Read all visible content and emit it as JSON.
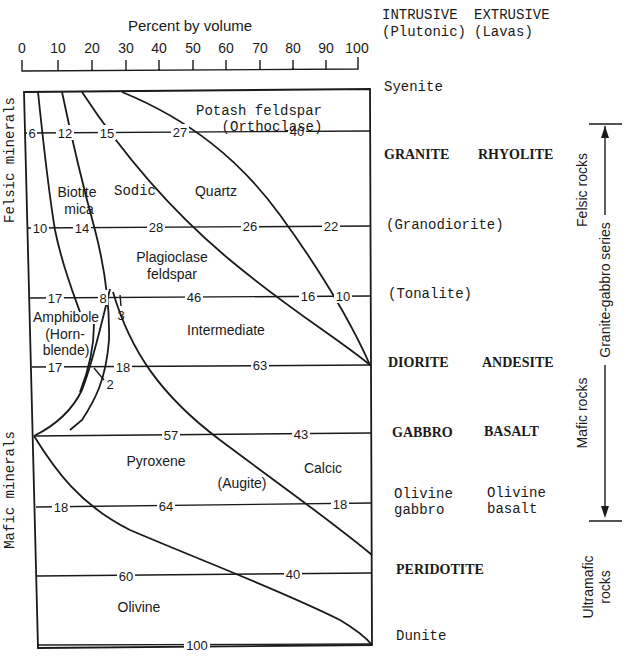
{
  "scale": {
    "title": "Percent by volume",
    "ticks": [
      "0",
      "10",
      "20",
      "30",
      "40",
      "50",
      "60",
      "70",
      "80",
      "90",
      "100"
    ]
  },
  "axis_labels": {
    "felsic_minerals": "Felsic minerals",
    "mafic_minerals": "Mafic minerals"
  },
  "column_headers": {
    "intrusive": "INTRUSIVE",
    "intrusive_sub": "(Plutonic)",
    "extrusive": "EXTRUSIVE",
    "extrusive_sub": "(Lavas)"
  },
  "mineral_labels": {
    "potash_feldspar": "Potash feldspar",
    "orthoclase": "(Orthoclase)",
    "biotite": "Biotite",
    "mica": "mica",
    "sodic": "Sodic",
    "quartz": "Quartz",
    "plagioclase": "Plagioclase",
    "feldspar": "feldspar",
    "amphibole": "Amphibole",
    "horn": "(Horn-",
    "blende": "blende)",
    "intermediate": "Intermediate",
    "pyroxene": "Pyroxene",
    "augite": "(Augite)",
    "calcic": "Calcic",
    "olivine": "Olivine"
  },
  "rows": [
    {
      "intrusive": "Syenite",
      "extrusive": "",
      "bold": false,
      "values": []
    },
    {
      "intrusive": "GRANITE",
      "extrusive": "RHYOLITE",
      "bold": true,
      "values": [
        "6",
        "12",
        "15",
        "27",
        "40"
      ]
    },
    {
      "intrusive": "(Granodiorite)",
      "extrusive": "",
      "bold": false,
      "values": [
        "10",
        "14",
        "28",
        "26",
        "22"
      ]
    },
    {
      "intrusive": "(Tonalite)",
      "extrusive": "",
      "bold": false,
      "values": [
        "17",
        "8",
        "3",
        "46",
        "16",
        "10"
      ]
    },
    {
      "intrusive": "DIORITE",
      "extrusive": "ANDESITE",
      "bold": true,
      "values": [
        "17",
        "18",
        "2",
        "63"
      ]
    },
    {
      "intrusive": "GABBRO",
      "extrusive": "BASALT",
      "bold": true,
      "values": [
        "57",
        "43"
      ]
    },
    {
      "intrusive": "Olivine",
      "intrusive2": "gabbro",
      "extrusive": "Olivine",
      "extrusive2": "basalt",
      "bold": false,
      "values": [
        "18",
        "64",
        "18"
      ]
    },
    {
      "intrusive": "PERIDOTITE",
      "extrusive": "",
      "bold": true,
      "values": [
        "60",
        "40"
      ]
    },
    {
      "intrusive": "Dunite",
      "extrusive": "",
      "bold": false,
      "values": [
        "100"
      ]
    }
  ],
  "series_brackets": {
    "felsic_rocks": "Felsic rocks",
    "granite_gabbro_series": "Granite-gabbro series",
    "mafic_rocks": "Mafic rocks",
    "ultramafic": "Ultramafic",
    "rocks": "rocks"
  }
}
